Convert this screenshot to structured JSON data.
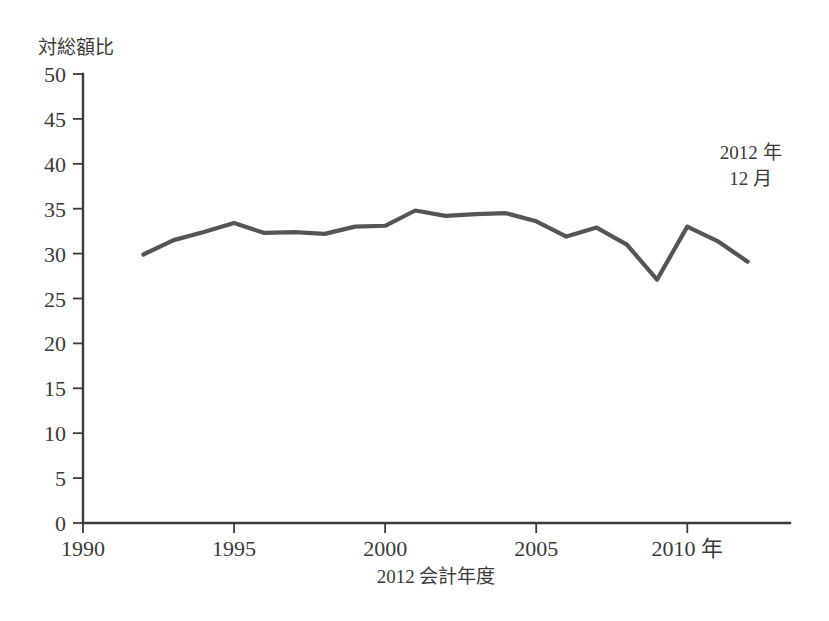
{
  "chart_data": {
    "type": "line",
    "title": "",
    "subtitle": "",
    "xlabel": "2012 会計年度",
    "ylabel": "対総額比",
    "xlim": [
      1990,
      2013.4
    ],
    "ylim": [
      0,
      50
    ],
    "grid": false,
    "legend_position": "none",
    "x_ticks": [
      {
        "value": 1990,
        "label": "1990"
      },
      {
        "value": 1995,
        "label": "1995"
      },
      {
        "value": 2000,
        "label": "2000"
      },
      {
        "value": 2005,
        "label": "2005"
      },
      {
        "value": 2010,
        "label": "2010 年"
      }
    ],
    "y_ticks": [
      {
        "value": 0,
        "label": "0"
      },
      {
        "value": 5,
        "label": "5"
      },
      {
        "value": 10,
        "label": "10"
      },
      {
        "value": 15,
        "label": "15"
      },
      {
        "value": 20,
        "label": "20"
      },
      {
        "value": 25,
        "label": "25"
      },
      {
        "value": 30,
        "label": "30"
      },
      {
        "value": 35,
        "label": "35"
      },
      {
        "value": 40,
        "label": "40"
      },
      {
        "value": 45,
        "label": "45"
      },
      {
        "value": 50,
        "label": "50"
      }
    ],
    "series": [
      {
        "name": "対総額比",
        "color": "#555555",
        "x": [
          1992,
          1993,
          1994,
          1995,
          1996,
          1997,
          1998,
          1999,
          2000,
          2001,
          2002,
          2003,
          2004,
          2005,
          2006,
          2007,
          2008,
          2009,
          2010,
          2011,
          2012
        ],
        "values": [
          29.9,
          31.5,
          32.4,
          33.4,
          32.3,
          32.4,
          32.2,
          33.0,
          33.1,
          34.8,
          34.2,
          34.4,
          34.5,
          33.6,
          31.9,
          32.9,
          31.0,
          27.1,
          33.0,
          31.4,
          29.1
        ]
      }
    ],
    "annotations": [
      {
        "name": "end-point-callout",
        "lines": [
          "2012 年",
          "12 月"
        ],
        "x": 2012.1,
        "y": 40.5
      }
    ],
    "colors": {
      "line": "#555555",
      "axis": "#3c3c3c",
      "text": "#3a3a3a",
      "background": "#ffffff"
    }
  }
}
